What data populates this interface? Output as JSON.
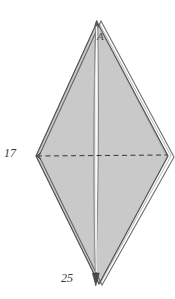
{
  "figure": {
    "background_color": "#ffffff",
    "fill_color": "#c8c8c8",
    "edge_color": "#4a4a4a",
    "axis_color": "#8a8a8a",
    "dashed_color": "#3c3c3c",
    "labels": {
      "left_dimension": "17",
      "bottom_dimension": "25",
      "apex_vertex": "A"
    },
    "caption": "",
    "geometry": {
      "apex_top": [
        97,
        22
      ],
      "vertex_left": [
        36,
        156
      ],
      "vertex_right": [
        168,
        156
      ],
      "apex_bottom": [
        99,
        284
      ],
      "axis_top": [
        96,
        20
      ],
      "axis_bottom": [
        98,
        286
      ],
      "dashed_line_from": [
        37,
        156
      ],
      "dashed_line_to": [
        167,
        155
      ],
      "second_face_offset_x": 7
    }
  }
}
